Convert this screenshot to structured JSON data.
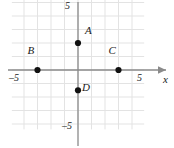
{
  "figure": {
    "kind": "coordinate-plane",
    "axis_x_label": "x",
    "axis_y_label": "",
    "background_color": "#ffffff",
    "grid_color": "#e3e3e3",
    "axis_color": "#8a8a8a",
    "point_color": "#111111",
    "label_color": "#1a1a1a"
  },
  "ticks": {
    "x_left": "–5",
    "x_right": "5",
    "y_top": "5",
    "y_bottom": "–5"
  },
  "chart_data": {
    "type": "scatter",
    "title": "",
    "xlabel": "x",
    "ylabel": "",
    "xlim": [
      -5,
      5
    ],
    "ylim": [
      -5,
      5
    ],
    "grid": true,
    "grid_step": 1,
    "legend": "none",
    "tick_labels": {
      "x": [
        "–5",
        "5"
      ],
      "y": [
        "5",
        "–5"
      ]
    },
    "points": [
      {
        "label": "A",
        "x": 0,
        "y": 2,
        "label_dx": 7,
        "label_dy": -9
      },
      {
        "label": "B",
        "x": -3,
        "y": 0,
        "label_dx": -10,
        "label_dy": -16
      },
      {
        "label": "C",
        "x": 3,
        "y": 0,
        "label_dx": -10,
        "label_dy": -16
      },
      {
        "label": "D",
        "x": 0,
        "y": -1.5,
        "label_dx": 4,
        "label_dy": 1
      }
    ]
  }
}
